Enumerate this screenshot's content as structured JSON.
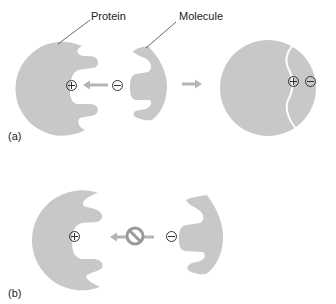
{
  "labels": {
    "protein": "Protein",
    "molecule": "Molecule",
    "panel_a": "(a)",
    "panel_b": "(b)"
  },
  "symbols": {
    "positive": "plus-charge",
    "negative": "minus-charge",
    "prohibited": "no-entry"
  },
  "colors": {
    "shape_fill": "#c8c8c8",
    "arrow": "#b4b4b4",
    "prohibited_ring": "#9a9a9a",
    "text": "#222222",
    "background": "#ffffff"
  }
}
